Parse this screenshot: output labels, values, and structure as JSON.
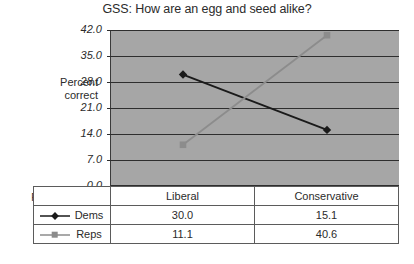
{
  "chart_data": {
    "type": "line",
    "title": "GSS: How are an egg and seed alike?",
    "xlabel": "Political view s>",
    "ylabel_lines": [
      "Percent",
      "correct"
    ],
    "categories": [
      "Liberal",
      "Conservative"
    ],
    "series": [
      {
        "name": "Dems",
        "values": [
          30.0,
          15.1
        ],
        "color": "#1a1a1a",
        "marker": "diamond"
      },
      {
        "name": "Reps",
        "values": [
          11.1,
          40.6
        ],
        "color": "#8c8c8c",
        "marker": "square"
      }
    ],
    "yticks": [
      "0.0",
      "7.0",
      "14.0",
      "21.0",
      "28.0",
      "35.0",
      "42.0"
    ],
    "ytick_values": [
      0.0,
      7.0,
      14.0,
      21.0,
      28.0,
      35.0,
      42.0
    ],
    "ylim": [
      0.0,
      42.0
    ],
    "grid": true,
    "legend_position": "table-left",
    "plot_background": "#a6a6a6",
    "page_background": "#ffffff",
    "table": {
      "header": [
        "",
        "Liberal",
        "Conservative"
      ],
      "rows": [
        {
          "label": "Dems",
          "cells": [
            "30.0",
            "15.1"
          ]
        },
        {
          "label": "Reps",
          "cells": [
            "11.1",
            "40.6"
          ]
        }
      ]
    }
  }
}
